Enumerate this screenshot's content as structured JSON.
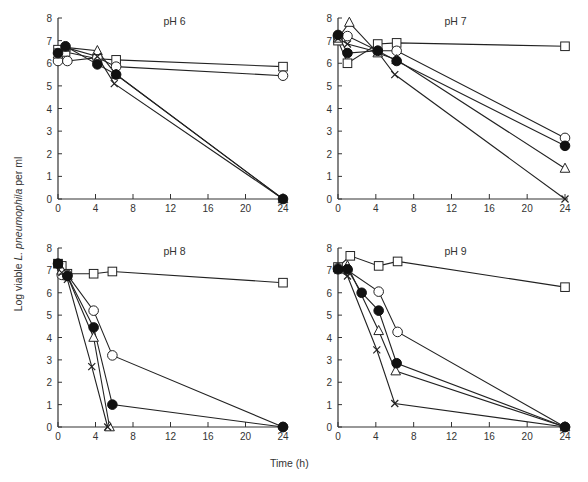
{
  "figure": {
    "ylabel_prefix": "Log viable ",
    "ylabel_species": "L. pneumophila",
    "ylabel_suffix": " per ml",
    "xlabel": "Time (h)"
  },
  "chart_data": [
    {
      "type": "line",
      "title": "pH 6",
      "xlabel": "Time (h)",
      "ylabel": "Log viable L. pneumophila per ml",
      "xlim": [
        0,
        24
      ],
      "ylim": [
        0,
        8
      ],
      "xticks": [
        0,
        4,
        8,
        12,
        16,
        20,
        24
      ],
      "yticks": [
        0,
        1,
        2,
        3,
        4,
        5,
        6,
        7,
        8
      ],
      "grid": false,
      "series": [
        {
          "name": "open-square",
          "marker": "square-open",
          "x": [
            0,
            0.8,
            4.2,
            6.2,
            24
          ],
          "y": [
            6.6,
            6.5,
            6.2,
            6.15,
            5.85
          ]
        },
        {
          "name": "open-circle",
          "marker": "circle-open",
          "x": [
            0,
            1,
            4.2,
            6.2,
            24
          ],
          "y": [
            6.1,
            6.1,
            6.25,
            5.85,
            5.45
          ]
        },
        {
          "name": "open-triangle",
          "marker": "triangle-open",
          "x": [
            0,
            0.8,
            4.2,
            6.2,
            24
          ],
          "y": [
            6.4,
            6.7,
            6.55,
            5.5,
            0
          ]
        },
        {
          "name": "cross",
          "marker": "cross",
          "x": [
            0,
            0.8,
            4.2,
            6,
            24
          ],
          "y": [
            6.5,
            6.7,
            6.3,
            5.1,
            0
          ]
        },
        {
          "name": "filled-circle",
          "marker": "circle-filled",
          "x": [
            0,
            0.8,
            4.2,
            6.2,
            24
          ],
          "y": [
            6.45,
            6.75,
            5.95,
            5.5,
            0
          ]
        }
      ]
    },
    {
      "type": "line",
      "title": "pH 7",
      "xlabel": "Time (h)",
      "ylabel": "Log viable L. pneumophila per ml",
      "xlim": [
        0,
        24
      ],
      "ylim": [
        0,
        8
      ],
      "xticks": [
        0,
        4,
        8,
        12,
        16,
        20,
        24
      ],
      "yticks": [
        0,
        1,
        2,
        3,
        4,
        5,
        6,
        7,
        8
      ],
      "grid": false,
      "series": [
        {
          "name": "open-square",
          "marker": "square-open",
          "x": [
            0,
            1,
            4.2,
            6.2,
            24
          ],
          "y": [
            7.0,
            6.0,
            6.85,
            6.9,
            6.75
          ]
        },
        {
          "name": "open-circle",
          "marker": "circle-open",
          "x": [
            0,
            1,
            4.2,
            6.2,
            24
          ],
          "y": [
            7.2,
            7.2,
            6.55,
            6.55,
            2.7
          ]
        },
        {
          "name": "open-triangle",
          "marker": "triangle-open",
          "x": [
            0,
            1.2,
            4.2,
            6.2,
            24
          ],
          "y": [
            7.1,
            7.8,
            6.45,
            6.15,
            1.35
          ]
        },
        {
          "name": "cross",
          "marker": "cross",
          "x": [
            0,
            1,
            4.2,
            6,
            24
          ],
          "y": [
            7.1,
            6.85,
            6.5,
            5.5,
            0
          ]
        },
        {
          "name": "filled-circle",
          "marker": "circle-filled",
          "x": [
            0,
            1,
            4.2,
            6.2,
            24
          ],
          "y": [
            7.25,
            6.45,
            6.55,
            6.1,
            2.35
          ]
        }
      ]
    },
    {
      "type": "line",
      "title": "pH 8",
      "xlabel": "Time (h)",
      "ylabel": "Log viable L. pneumophila per ml",
      "xlim": [
        0,
        24
      ],
      "ylim": [
        0,
        8
      ],
      "xticks": [
        0,
        4,
        8,
        12,
        16,
        20,
        24
      ],
      "yticks": [
        0,
        1,
        2,
        3,
        4,
        5,
        6,
        7,
        8
      ],
      "grid": false,
      "series": [
        {
          "name": "open-square",
          "marker": "square-open",
          "x": [
            0.4,
            1,
            3.8,
            5.8,
            24
          ],
          "y": [
            7.2,
            6.85,
            6.85,
            6.95,
            6.45
          ]
        },
        {
          "name": "open-circle",
          "marker": "circle-open",
          "x": [
            0.4,
            1,
            3.8,
            5.8,
            24
          ],
          "y": [
            6.8,
            6.8,
            5.2,
            3.2,
            0
          ]
        },
        {
          "name": "open-triangle",
          "marker": "triangle-open",
          "x": [
            0.4,
            1,
            3.8,
            5.5
          ],
          "y": [
            7.0,
            6.75,
            4.0,
            0
          ]
        },
        {
          "name": "cross",
          "marker": "cross",
          "x": [
            0.4,
            1,
            3.6,
            5.3
          ],
          "y": [
            6.9,
            6.6,
            2.7,
            0
          ]
        },
        {
          "name": "filled-circle",
          "marker": "circle-filled",
          "x": [
            0,
            1,
            3.8,
            5.8,
            24
          ],
          "y": [
            7.3,
            6.75,
            4.45,
            1.0,
            0
          ]
        },
        {
          "name": "filled-square",
          "marker": "square-filled",
          "x": [
            0
          ],
          "y": [
            7.3
          ]
        }
      ]
    },
    {
      "type": "line",
      "title": "pH 9",
      "xlabel": "Time (h)",
      "ylabel": "Log viable L. pneumophila per ml",
      "xlim": [
        0,
        24
      ],
      "ylim": [
        0,
        8
      ],
      "xticks": [
        0,
        4,
        8,
        12,
        16,
        20,
        24
      ],
      "yticks": [
        0,
        1,
        2,
        3,
        4,
        5,
        6,
        7,
        8
      ],
      "grid": false,
      "series": [
        {
          "name": "open-square",
          "marker": "square-open",
          "x": [
            0,
            1.3,
            4.3,
            6.3,
            24
          ],
          "y": [
            7.15,
            7.65,
            7.2,
            7.4,
            6.25
          ]
        },
        {
          "name": "open-circle",
          "marker": "circle-open",
          "x": [
            0,
            1,
            4.3,
            6.3,
            24
          ],
          "y": [
            7.1,
            7.0,
            6.05,
            4.25,
            0
          ]
        },
        {
          "name": "open-triangle",
          "marker": "triangle-open",
          "x": [
            0,
            1,
            4.3,
            6.1,
            24
          ],
          "y": [
            7.1,
            7.2,
            4.3,
            2.5,
            0
          ]
        },
        {
          "name": "cross",
          "marker": "cross",
          "x": [
            0,
            1,
            4.1,
            6,
            24
          ],
          "y": [
            7.0,
            6.75,
            3.45,
            1.05,
            0
          ]
        },
        {
          "name": "filled-circle",
          "marker": "circle-filled",
          "x": [
            0,
            1,
            2.5,
            4.3,
            6.2,
            24
          ],
          "y": [
            7.05,
            7.05,
            6.0,
            5.2,
            2.85,
            0
          ]
        }
      ]
    }
  ]
}
